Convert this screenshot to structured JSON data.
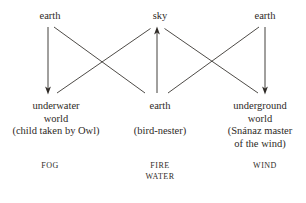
{
  "diagram": {
    "type": "mythic-cosmology-transformation-diagram",
    "background_color": "#ffffff",
    "ink_color": "#2e2a26",
    "top_row": [
      {
        "id": "top-left",
        "lines": [
          "earth"
        ]
      },
      {
        "id": "top-mid",
        "lines": [
          "sky"
        ]
      },
      {
        "id": "top-right",
        "lines": [
          "earth"
        ]
      }
    ],
    "bottom_row": [
      {
        "id": "bottom-left",
        "lines": [
          "underwater",
          "world",
          "(child taken by Owl)"
        ],
        "blank_after": 0
      },
      {
        "id": "bottom-mid",
        "lines": [
          "earth",
          "",
          "(bird-nester)"
        ],
        "blank_after": 1
      },
      {
        "id": "bottom-right",
        "lines": [
          "underground",
          "world",
          "(Snánaz master",
          "of the wind)"
        ],
        "blank_after": 0
      }
    ],
    "element_row": [
      {
        "id": "fog",
        "lines": [
          "FOG"
        ]
      },
      {
        "id": "fire-water",
        "lines": [
          "FIRE",
          "WATER"
        ]
      },
      {
        "id": "wind",
        "lines": [
          "WIND"
        ]
      }
    ],
    "arrows": [
      {
        "id": "earth-left-to-underwater",
        "from": "top-left",
        "to": "bottom-left",
        "direction": "down",
        "x1": 48,
        "y1": 27,
        "x2": 48,
        "y2": 94
      },
      {
        "id": "earth-left-to-earth-mid",
        "from": "top-left",
        "to": "bottom-mid",
        "direction": "none",
        "x1": 54,
        "y1": 27,
        "x2": 145,
        "y2": 93
      },
      {
        "id": "earth-mid-to-sky",
        "from": "bottom-mid",
        "to": "top-mid",
        "direction": "up",
        "x1": 157,
        "y1": 93,
        "x2": 157,
        "y2": 27
      },
      {
        "id": "underwater-to-sky",
        "from": "bottom-left",
        "to": "top-mid",
        "direction": "none",
        "x1": 56,
        "y1": 93,
        "x2": 150,
        "y2": 28
      },
      {
        "id": "sky-to-underground",
        "from": "top-mid",
        "to": "bottom-right",
        "direction": "none",
        "x1": 166,
        "y1": 28,
        "x2": 258,
        "y2": 93
      },
      {
        "id": "earth-mid-to-earth-right",
        "from": "bottom-mid",
        "to": "top-right",
        "direction": "none",
        "x1": 168,
        "y1": 93,
        "x2": 259,
        "y2": 27
      },
      {
        "id": "earth-right-to-underground",
        "from": "top-right",
        "to": "bottom-right",
        "direction": "down",
        "x1": 265,
        "y1": 27,
        "x2": 265,
        "y2": 94
      }
    ]
  }
}
